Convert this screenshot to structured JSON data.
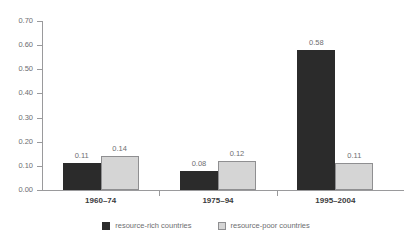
{
  "chart_data": {
    "type": "bar",
    "title": "",
    "subtitle": "",
    "xlabel": "",
    "ylabel": "",
    "categories": [
      "1960–74",
      "1975–94",
      "1995–2004"
    ],
    "series": [
      {
        "name": "resource-rich countries",
        "color": "#2b2b2b",
        "values": [
          0.11,
          0.08,
          0.58
        ],
        "labels": [
          "0.11",
          "0.08",
          "0.58"
        ]
      },
      {
        "name": "resource-poor countries",
        "color": "#d5d5d5",
        "values": [
          0.14,
          0.12,
          0.11
        ],
        "labels": [
          "0.14",
          "0.12",
          "0.11"
        ]
      }
    ],
    "ylim": [
      0.0,
      0.7
    ],
    "ytick_labels": [
      "0.70",
      "0.60",
      "0.50",
      "0.40",
      "0.30",
      "0.20",
      "0.10",
      "0.00"
    ],
    "ytick_values": [
      0.7,
      0.6,
      0.5,
      0.4,
      0.3,
      0.2,
      0.1,
      0.0
    ],
    "grid": false,
    "legend_position": "bottom"
  },
  "legend": {
    "items": [
      {
        "label": "resource-rich countries",
        "swatch": "dark-square-icon"
      },
      {
        "label": "resource-poor countries",
        "swatch": "light-square-icon"
      }
    ]
  }
}
